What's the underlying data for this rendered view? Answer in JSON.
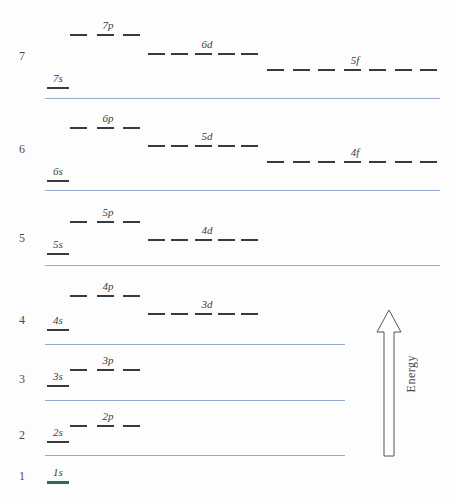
{
  "chart_data": {
    "type": "diagram",
    "ylabel": "Energy",
    "axis_direction": "increasing upward",
    "shell_numbers": [
      "7",
      "6",
      "5",
      "4",
      "3",
      "2",
      "1"
    ],
    "orbitals": [
      {
        "label": "7p",
        "shell": 7,
        "type": "p",
        "slots": 3,
        "x_start": 70,
        "x_end": 140,
        "y": 34,
        "label_x": 108,
        "label_y": 20
      },
      {
        "label": "6d",
        "shell": 7,
        "type": "d",
        "slots": 5,
        "x_start": 148,
        "x_end": 258,
        "y": 53,
        "label_x": 207,
        "label_y": 39
      },
      {
        "label": "5f",
        "shell": 7,
        "type": "f",
        "slots": 7,
        "x_start": 267,
        "x_end": 437,
        "y": 69,
        "label_x": 355,
        "label_y": 55
      },
      {
        "label": "7s",
        "shell": 7,
        "type": "s",
        "slots": 1,
        "x_start": 47,
        "x_end": 70,
        "y": 87,
        "label_x": 58,
        "label_y": 73
      },
      {
        "label": "6p",
        "shell": 6,
        "type": "p",
        "slots": 3,
        "x_start": 70,
        "x_end": 140,
        "y": 127,
        "label_x": 108,
        "label_y": 113
      },
      {
        "label": "5d",
        "shell": 6,
        "type": "d",
        "slots": 5,
        "x_start": 148,
        "x_end": 258,
        "y": 145,
        "label_x": 207,
        "label_y": 131
      },
      {
        "label": "4f",
        "shell": 6,
        "type": "f",
        "slots": 7,
        "x_start": 267,
        "x_end": 437,
        "y": 161,
        "label_x": 355,
        "label_y": 147
      },
      {
        "label": "6s",
        "shell": 6,
        "type": "s",
        "slots": 1,
        "x_start": 47,
        "x_end": 70,
        "y": 180,
        "label_x": 58,
        "label_y": 166
      },
      {
        "label": "5p",
        "shell": 5,
        "type": "p",
        "slots": 3,
        "x_start": 70,
        "x_end": 140,
        "y": 221,
        "label_x": 108,
        "label_y": 207
      },
      {
        "label": "4d",
        "shell": 5,
        "type": "d",
        "slots": 5,
        "x_start": 148,
        "x_end": 258,
        "y": 239,
        "label_x": 207,
        "label_y": 225
      },
      {
        "label": "5s",
        "shell": 5,
        "type": "s",
        "slots": 1,
        "x_start": 47,
        "x_end": 70,
        "y": 253,
        "label_x": 58,
        "label_y": 239
      },
      {
        "label": "4p",
        "shell": 4,
        "type": "p",
        "slots": 3,
        "x_start": 142,
        "x_end": 142,
        "y": 295,
        "label_x": 108,
        "label_y": 281
      },
      {
        "label": "3d",
        "shell": 4,
        "type": "d",
        "slots": 5,
        "x_start": 148,
        "x_end": 258,
        "y": 313,
        "label_x": 207,
        "label_y": 299
      },
      {
        "label": "4s",
        "shell": 4,
        "type": "s",
        "slots": 1,
        "x_start": 47,
        "x_end": 70,
        "y": 329,
        "label_x": 58,
        "label_y": 315
      },
      {
        "label": "3p",
        "shell": 3,
        "type": "p",
        "slots": 3,
        "x_start": 70,
        "x_end": 140,
        "y": 369,
        "label_x": 108,
        "label_y": 355
      },
      {
        "label": "3s",
        "shell": 3,
        "type": "s",
        "slots": 1,
        "x_start": 47,
        "x_end": 70,
        "y": 385,
        "label_x": 58,
        "label_y": 371
      },
      {
        "label": "2p",
        "shell": 2,
        "type": "p",
        "slots": 3,
        "x_start": 70,
        "x_end": 140,
        "y": 425,
        "label_x": 108,
        "label_y": 411
      },
      {
        "label": "2s",
        "shell": 2,
        "type": "s",
        "slots": 1,
        "x_start": 47,
        "x_end": 70,
        "y": 441,
        "label_x": 58,
        "label_y": 427
      },
      {
        "label": "1s",
        "shell": 1,
        "type": "s",
        "slots": 1,
        "x_start": 47,
        "x_end": 70,
        "y": 481,
        "label_x": 58,
        "label_y": 467
      }
    ],
    "separators": [
      {
        "y": 98,
        "x_start": 45,
        "x_end": 440
      },
      {
        "y": 190,
        "x_start": 45,
        "x_end": 440
      },
      {
        "y": 265,
        "x_start": 45,
        "x_end": 440
      },
      {
        "y": 344,
        "x_start": 45,
        "x_end": 345
      },
      {
        "y": 400,
        "x_start": 45,
        "x_end": 345
      },
      {
        "y": 455,
        "x_start": 45,
        "x_end": 345
      }
    ],
    "colors": {
      "separator": "#8fa8cc",
      "dash": "#3a3a3a",
      "label": "#3c3c3c",
      "ground_state": "#2f6b4f"
    }
  },
  "shell_labels": [
    {
      "n": "7",
      "y": 50
    },
    {
      "n": "6",
      "y": 143
    },
    {
      "n": "5",
      "y": 232
    },
    {
      "n": "4",
      "y": 314
    },
    {
      "n": "3",
      "y": 373
    },
    {
      "n": "2",
      "y": 429
    },
    {
      "n": "1",
      "y": 470
    }
  ],
  "energy_axis": {
    "label": "Energy",
    "arrow_x": 374,
    "arrow_top": 308,
    "arrow_bottom": 458,
    "label_x": 404,
    "label_y": 355
  }
}
